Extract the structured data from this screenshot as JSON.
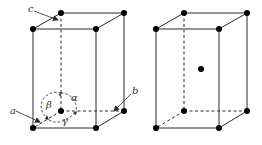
{
  "figure": {
    "left_cell": {
      "name": "simple-tetragonal-unit-cell",
      "labels": {
        "a": "a",
        "b": "b",
        "c": "c",
        "alpha": "α",
        "beta": "β",
        "gamma": "γ"
      }
    },
    "right_cell": {
      "name": "body-centered-tetragonal-unit-cell"
    },
    "colors": {
      "line": "#2a2a2a",
      "atom": "#000000",
      "background": "#ffffff"
    }
  }
}
